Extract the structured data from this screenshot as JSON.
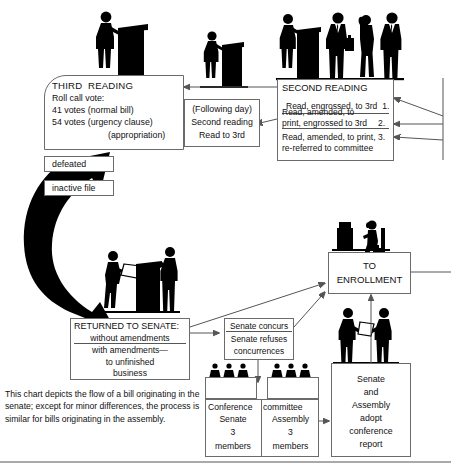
{
  "diagram": {
    "title": "Flow of a bill originating in the senate",
    "type": "flowchart",
    "caption": "This chart depicts the flow of a bill originating in the senate; except for minor differences, the process is similar for bills originating in the assembly."
  },
  "boxes": {
    "third_reading": {
      "heading": "THIRD  READING",
      "lines": [
        "Roll call vote:",
        "41 votes (normal bill)",
        "54 votes (urgency clause)",
        "(appropriation)"
      ]
    },
    "defeated": {
      "label": "defeated"
    },
    "inactive_file": {
      "label": "inactive file"
    },
    "following_day": {
      "lines": [
        "(Following day)",
        "Second reading",
        "Read to 3rd"
      ]
    },
    "second_reading": {
      "heading": "SECOND READING",
      "options": [
        {
          "text": "Read, engrossed, to 3rd",
          "number": "1."
        },
        {
          "text": "Read, amended, to\nprint, engrossed to 3rd",
          "number": "2."
        },
        {
          "text": "Read, amended, to print,\nre-referred to committee",
          "number": "3."
        }
      ]
    },
    "returned_to_senate": {
      "heading": "RETURNED TO SENATE:",
      "lines": [
        "without amendments",
        "with amendments—",
        "to unfinished",
        "business"
      ]
    },
    "senate_concurs": {
      "lines": [
        "Senate concurs",
        "Senate refuses",
        "concurrences"
      ]
    },
    "conference_committee": {
      "title_left": "Conference",
      "title_right": "committee",
      "left": {
        "chamber": "Senate",
        "count": "3",
        "unit": "members"
      },
      "right": {
        "chamber": "Assembly",
        "count": "3",
        "unit": "members"
      }
    },
    "adopt_report": {
      "lines": [
        "Senate",
        "and",
        "Assembly",
        "adopt",
        "conference",
        "report"
      ]
    },
    "to_enrollment": {
      "lines": [
        "TO",
        "ENROLLMENT"
      ]
    }
  },
  "icons": {
    "podium_speaker": "podium-speaker-silhouette",
    "standing_group": "standing-legislators-silhouette",
    "clerk_desk": "clerk-at-desk-silhouette",
    "handshake": "handshake-silhouette",
    "committee_members": "committee-members-silhouette",
    "bill_carrier": "bill-carrier-silhouette",
    "big_arrow": "large-black-curved-arrow"
  },
  "colors": {
    "ink": "#111111",
    "box_border": "#6b6b6b",
    "silhouette": "#000000",
    "connector": "#555555",
    "page": "#ffffff"
  }
}
